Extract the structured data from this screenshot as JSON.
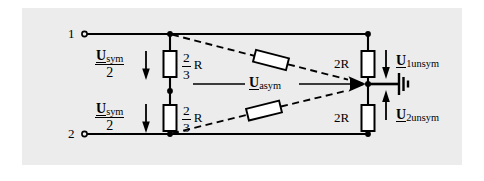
{
  "figure": {
    "type": "circuit-diagram",
    "background_color": "#ececed",
    "line_color": "#000000"
  },
  "terminals": [
    {
      "name": "terminal-1",
      "label": "1"
    },
    {
      "name": "terminal-2",
      "label": "2"
    }
  ],
  "source_labels": [
    {
      "name": "u-sym-upper",
      "symbol": "U",
      "subscript": "sym",
      "denominator": "2",
      "arrow": "down"
    },
    {
      "name": "u-sym-lower",
      "symbol": "U",
      "subscript": "sym",
      "denominator": "2",
      "arrow": "down"
    }
  ],
  "series_resistors": [
    {
      "name": "resistor-upper-left",
      "numerator": "2",
      "denominator": "3",
      "unit": "R"
    },
    {
      "name": "resistor-lower-left",
      "numerator": "2",
      "denominator": "3",
      "unit": "R"
    }
  ],
  "shunt_resistors": [
    {
      "name": "resistor-upper-right",
      "label": "2R"
    },
    {
      "name": "resistor-lower-right",
      "label": "2R"
    }
  ],
  "coupling_resistors": [
    {
      "name": "coupling-resistor-upper",
      "label": ""
    },
    {
      "name": "coupling-resistor-lower",
      "label": ""
    }
  ],
  "center_label": {
    "name": "u-asym",
    "symbol": "U",
    "subscript": "asym"
  },
  "output_labels": [
    {
      "name": "u1-unsym",
      "symbol": "U",
      "subscript": "1unsym",
      "arrow": "down"
    },
    {
      "name": "u2-unsym",
      "symbol": "U",
      "subscript": "2unsym",
      "arrow": "up"
    }
  ],
  "ground": {
    "name": "ground-symbol",
    "label": ""
  }
}
